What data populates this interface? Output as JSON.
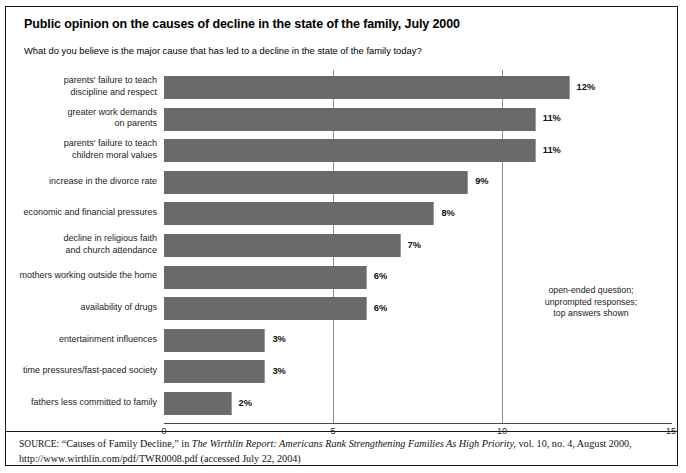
{
  "title": "Public opinion on the causes of decline in the state of the family, July 2000",
  "question": "What do you believe is the major cause that has led to a decline in the state of the family today?",
  "note": "open-ended question;\nunprompted responses;\ntop answers shown",
  "source": {
    "label": "SOURCE:",
    "quoted_title": "“Causes of Family Decline,”",
    "in_word": "in",
    "publication": "The Wirthlin Report: Americans Rank Strengthening Families As High Priority,",
    "volume_info": "vol. 10, no. 4, August 2000,",
    "url_line": "http://www.wirthlin.com/pdf/TWR0008.pdf (accessed July 22, 2004)"
  },
  "axis": {
    "ticks": [
      "0",
      "5",
      "10",
      "15"
    ],
    "tick_values": [
      0,
      5,
      10,
      15
    ]
  },
  "chart_data": {
    "type": "bar",
    "orientation": "horizontal",
    "title": "Public opinion on the causes of decline in the state of the family, July 2000",
    "subtitle": "What do you believe is the major cause that has led to a decline in the state of the family today?",
    "xlabel": "",
    "ylabel": "",
    "xlim": [
      0,
      15
    ],
    "grid": true,
    "gridlines": [
      5,
      10
    ],
    "legend": false,
    "bar_color": "#6a6a6a",
    "value_suffix": "%",
    "categories": [
      "parents' failure to teach\ndiscipline and respect",
      "greater work demands\non parents",
      "parents' failure to teach\nchildren moral values",
      "increase in the divorce rate",
      "economic and financial pressures",
      "decline in religious faith\nand church attendance",
      "mothers working outside the home",
      "availability of drugs",
      "entertainment influences",
      "time pressures/fast-paced society",
      "fathers less committed to family"
    ],
    "values": [
      12,
      11,
      11,
      9,
      8,
      7,
      6,
      6,
      3,
      3,
      2
    ],
    "value_labels": [
      "12%",
      "11%",
      "11%",
      "9%",
      "8%",
      "7%",
      "6%",
      "6%",
      "3%",
      "3%",
      "2%"
    ],
    "annotations": [
      "open-ended question; unprompted responses; top answers shown"
    ]
  }
}
